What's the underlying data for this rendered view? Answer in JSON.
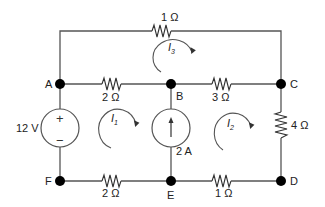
{
  "diagram": {
    "type": "circuit",
    "nodes": {
      "A": "A",
      "B": "B",
      "C": "C",
      "D": "D",
      "E": "E",
      "F": "F"
    },
    "components": {
      "r_top": {
        "label": "1 Ω",
        "between": "A-C (top branch)"
      },
      "r_ab": {
        "label": "2 Ω",
        "between": "A-B"
      },
      "r_bc": {
        "label": "3 Ω",
        "between": "B-C"
      },
      "r_cd": {
        "label": "4 Ω",
        "between": "C-D"
      },
      "r_fe": {
        "label": "2 Ω",
        "between": "F-E"
      },
      "r_ed": {
        "label": "1 Ω",
        "between": "E-D"
      },
      "v_src": {
        "label": "12 V",
        "between": "A-F",
        "plus": "+",
        "minus": "−"
      },
      "i_src": {
        "label": "2 A",
        "between": "E-B",
        "direction": "up"
      }
    },
    "loops": {
      "i1": {
        "main": "I",
        "sub": "1",
        "direction": "clockwise"
      },
      "i2": {
        "main": "I",
        "sub": "2",
        "direction": "clockwise"
      },
      "i3": {
        "main": "I",
        "sub": "3",
        "direction": "clockwise"
      }
    }
  }
}
